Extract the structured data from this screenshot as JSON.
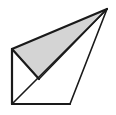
{
  "figure": {
    "type": "line-drawing",
    "canvas": {
      "width": 116,
      "height": 115,
      "background": "#ffffff"
    },
    "colors": {
      "stroke": "#1a1a1a",
      "shaded_fill": "#d4d4d4",
      "unshaded_fill": "#ffffff"
    },
    "stroke_width": 2,
    "vertices": {
      "apex": {
        "label": "apex",
        "x": 107,
        "y": 9
      },
      "left": {
        "label": "left-upper",
        "x": 12,
        "y": 49
      },
      "mid": {
        "label": "mid-lower",
        "x": 39,
        "y": 79
      },
      "bottom_left": {
        "label": "bottom-left",
        "x": 12,
        "y": 104
      },
      "bottom_right": {
        "label": "bottom-right",
        "x": 70,
        "y": 104
      }
    },
    "faces": [
      {
        "name": "shaded-face",
        "shaded": true,
        "fill": "#d4d4d4",
        "points": "107,9 12,49 39,79"
      },
      {
        "name": "front-face",
        "shaded": false,
        "fill": "#ffffff",
        "points": "12,49 12,104 39,79"
      },
      {
        "name": "base-face",
        "shaded": false,
        "fill": "#ffffff",
        "points": "12,104 70,104 107,9"
      }
    ],
    "edges": [
      {
        "name": "edge-apex-left",
        "x1": 107,
        "y1": 9,
        "x2": 12,
        "y2": 49
      },
      {
        "name": "edge-apex-mid",
        "x1": 107,
        "y1": 9,
        "x2": 39,
        "y2": 79
      },
      {
        "name": "edge-apex-bottomright",
        "x1": 107,
        "y1": 9,
        "x2": 70,
        "y2": 104
      },
      {
        "name": "edge-apex-bottomleft",
        "x1": 107,
        "y1": 9,
        "x2": 12,
        "y2": 104
      },
      {
        "name": "edge-left-mid",
        "x1": 12,
        "y1": 49,
        "x2": 39,
        "y2": 79
      },
      {
        "name": "edge-left-bottomleft",
        "x1": 12,
        "y1": 49,
        "x2": 12,
        "y2": 104
      },
      {
        "name": "edge-bottom",
        "x1": 12,
        "y1": 104,
        "x2": 70,
        "y2": 104
      }
    ]
  }
}
